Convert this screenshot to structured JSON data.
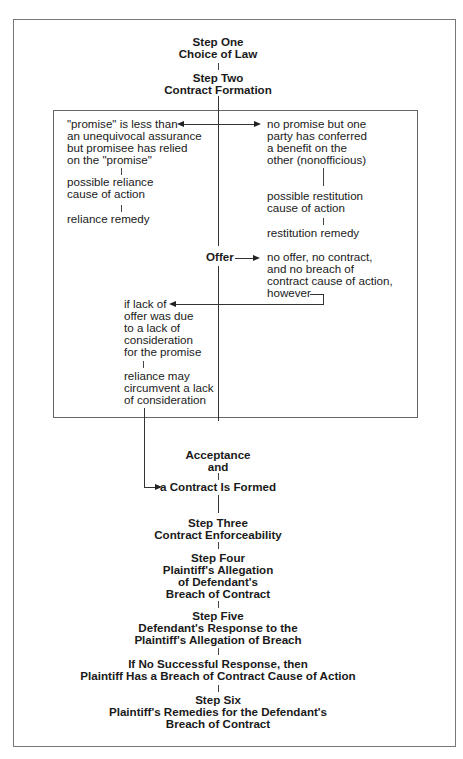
{
  "diagram": {
    "step_one": {
      "title": "Step One",
      "subtitle": "Choice of Law"
    },
    "step_two": {
      "title": "Step Two",
      "subtitle": "Contract Formation"
    },
    "formation_box": {
      "left_branch": {
        "lines": [
          "\"promise\" is less than",
          "an unequivocal assurance",
          "but promisee has relied",
          "on the \"promise\""
        ],
        "cause": [
          "possible reliance",
          "cause of action"
        ],
        "remedy": "reliance remedy"
      },
      "right_branch": {
        "lines": [
          "no promise but one",
          "party has conferred",
          "a benefit on the",
          "other (nonofficious)"
        ],
        "cause": [
          "possible restitution",
          "cause of action"
        ],
        "remedy": "restitution remedy"
      },
      "offer": {
        "label": "Offer",
        "no_offer": [
          "no offer, no contract,",
          "and no breach of",
          "contract cause of action,",
          "however"
        ]
      },
      "consideration": {
        "lines": [
          "if lack of",
          "offer was due",
          "to a lack of",
          "consideration",
          "for the promise"
        ],
        "reliance": [
          "reliance may",
          "circumvent a lack",
          "of consideration"
        ]
      }
    },
    "acceptance": {
      "line1": "Acceptance",
      "line2": "and"
    },
    "contract_formed": "a Contract Is Formed",
    "step_three": {
      "title": "Step Three",
      "subtitle": "Contract Enforceability"
    },
    "step_four": {
      "title": "Step Four",
      "lines": [
        "Plaintiff's Allegation",
        "of Defendant's",
        "Breach of Contract"
      ]
    },
    "step_five": {
      "title": "Step Five",
      "lines": [
        "Defendant's Response to the",
        "Plaintiff's Allegation of Breach"
      ]
    },
    "no_response": {
      "lines": [
        "If No Successful Response, then",
        "Plaintiff Has a Breach of Contract Cause of Action"
      ]
    },
    "step_six": {
      "title": "Step Six",
      "lines": [
        "Plaintiff's Remedies for the Defendant's",
        "Breach of Contract"
      ]
    }
  },
  "colors": {
    "line": "#333333",
    "border": "#6b6b6b",
    "text": "#1a1a1a"
  }
}
